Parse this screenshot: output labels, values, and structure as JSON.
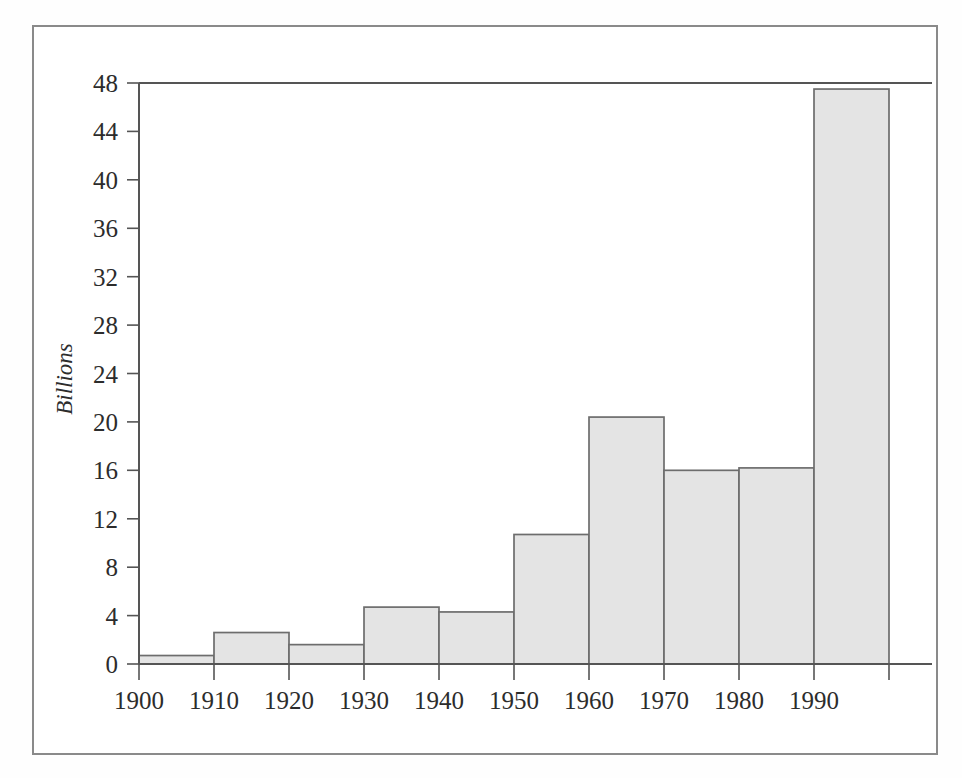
{
  "figure": {
    "background_color": "#ffffff",
    "frame_color": "#8a8a8a",
    "bar_fill_color": "#e4e4e4",
    "bar_stroke_color": "#6d6d6d",
    "axis_color": "#555555",
    "text_color": "#2c2c2c"
  },
  "chart_data": {
    "type": "bar",
    "title": "",
    "subtitle": "",
    "xlabel": "",
    "ylabel": "Billions",
    "categories": [
      "1900",
      "1910",
      "1920",
      "1930",
      "1940",
      "1950",
      "1960",
      "1970",
      "1980",
      "1990"
    ],
    "values": [
      0.7,
      2.6,
      1.6,
      4.7,
      4.3,
      10.7,
      20.4,
      16.0,
      16.2,
      47.5
    ],
    "xtick_labels": [
      "1900",
      "1910",
      "1920",
      "1930",
      "1940",
      "1950",
      "1960",
      "1970",
      "1980",
      "1990"
    ],
    "ytick_labels": [
      "0",
      "4",
      "8",
      "12",
      "16",
      "20",
      "24",
      "28",
      "32",
      "36",
      "40",
      "44",
      "48"
    ],
    "ytick_values": [
      0,
      4,
      8,
      12,
      16,
      20,
      24,
      28,
      32,
      36,
      40,
      44,
      48
    ],
    "ylim": [
      0,
      48
    ],
    "xlim": [
      1900,
      2000
    ],
    "bar_width_years": 10,
    "grid": false,
    "legend": null,
    "annotations": []
  }
}
